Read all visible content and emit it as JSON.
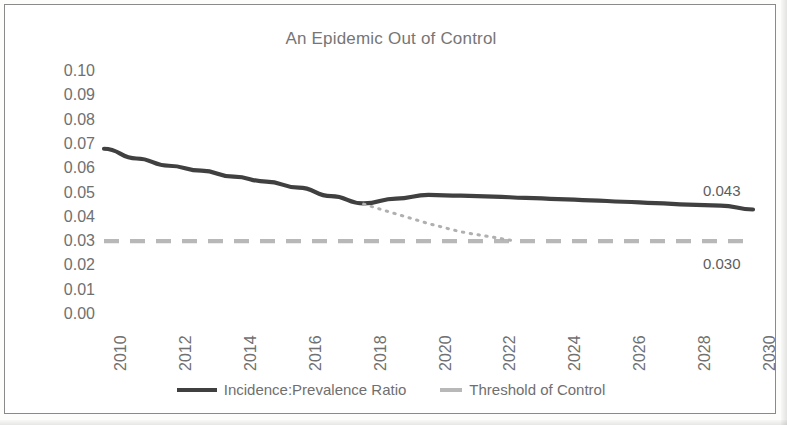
{
  "chart_data": {
    "type": "line",
    "title": "An Epidemic Out of Control",
    "xlabel": "",
    "ylabel": "",
    "xlim": [
      2010,
      2030
    ],
    "ylim": [
      0.0,
      0.1
    ],
    "grid": false,
    "legend_position": "bottom",
    "x_tick_labels": [
      "2010",
      "2012",
      "2014",
      "2016",
      "2018",
      "2020",
      "2022",
      "2024",
      "2026",
      "2028",
      "2030"
    ],
    "y_tick_labels": [
      "0.10",
      "0.09",
      "0.08",
      "0.07",
      "0.06",
      "0.05",
      "0.04",
      "0.03",
      "0.02",
      "0.01",
      "0.00"
    ],
    "y_tick_values": [
      0.1,
      0.09,
      0.08,
      0.07,
      0.06,
      0.05,
      0.04,
      0.03,
      0.02,
      0.01,
      0.0
    ],
    "x": [
      2010,
      2011,
      2012,
      2013,
      2014,
      2015,
      2016,
      2017,
      2018,
      2019,
      2020,
      2021,
      2022,
      2023,
      2024,
      2025,
      2026,
      2027,
      2028,
      2029,
      2030
    ],
    "series": [
      {
        "name": "Incidence:Prevalence Ratio",
        "style": "solid",
        "color": "#404040",
        "values": [
          0.068,
          0.064,
          0.061,
          0.059,
          0.0565,
          0.0545,
          0.052,
          0.0485,
          0.0455,
          0.0475,
          0.049,
          0.0487,
          0.0483,
          0.0478,
          0.0473,
          0.0468,
          0.0462,
          0.0456,
          0.045,
          0.0446,
          0.043
        ]
      },
      {
        "name": "Threshold of Control",
        "style": "dashed",
        "color": "#b8b8b8",
        "values": [
          0.03,
          0.03,
          0.03,
          0.03,
          0.03,
          0.03,
          0.03,
          0.03,
          0.03,
          0.03,
          0.03,
          0.03,
          0.03,
          0.03,
          0.03,
          0.03,
          0.03,
          0.03,
          0.03,
          0.03,
          0.03
        ]
      },
      {
        "name": "Projected path to control",
        "style": "dotted",
        "color": "#b0b0b0",
        "x": [
          2018,
          2019,
          2020,
          2021,
          2022.7
        ],
        "values": [
          0.0452,
          0.0412,
          0.0372,
          0.0338,
          0.03
        ]
      }
    ],
    "annotations": [
      {
        "text": "0.043",
        "x": 2030,
        "y": 0.043,
        "position": "above-right"
      },
      {
        "text": "0.030",
        "x": 2030,
        "y": 0.03,
        "position": "below-right"
      }
    ],
    "legend": [
      {
        "label": "Incidence:Prevalence Ratio",
        "marker": "solid-line",
        "color": "#404040"
      },
      {
        "label": "Threshold of Control",
        "marker": "dashed-line",
        "color": "#b8b8b8"
      }
    ]
  },
  "colors": {
    "series_primary": "#404040",
    "threshold": "#b8b8b8",
    "projection": "#b0b0b0",
    "title_text": "#767676",
    "tick_text": "#707070",
    "frame_border": "#8a8a8a"
  }
}
